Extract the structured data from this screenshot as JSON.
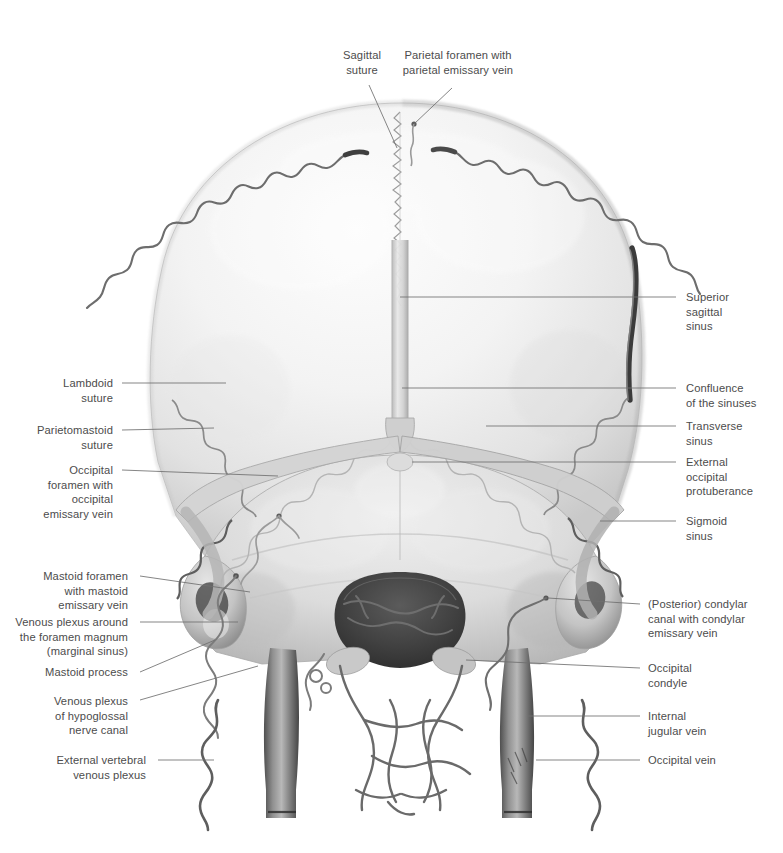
{
  "figure": {
    "kind": "anatomical-illustration",
    "view": "posterior view of skull with dural venous sinuses and emissary veins",
    "background_color": "#ffffff",
    "text_color": "#4c4c4c",
    "leader_color": "#6b6b6b",
    "bone_light": "#f4f4f4",
    "bone_mid": "#d8d8d8",
    "bone_shadow": "#9a9a9a",
    "vein_dark": "#4a4a4a",
    "vein_mid": "#8d8d8d"
  },
  "labels": {
    "sagittal_suture": "Sagittal\nsuture",
    "parietal_foramen": "Parietal foramen with\nparietal emissary vein",
    "superior_sagittal_sinus": "Superior\nsagittal\nsinus",
    "confluence_of_sinuses": "Confluence\nof the sinuses",
    "transverse_sinus": "Transverse\nsinus",
    "external_occipital_protuberance": "External\noccipital\nprotuberance",
    "sigmoid_sinus": "Sigmoid\nsinus",
    "posterior_condylar_canal": "(Posterior) condylar\ncanal with condylar\nemissary vein",
    "occipital_condyle": "Occipital\ncondyle",
    "internal_jugular_vein": "Internal\njugular vein",
    "occipital_vein": "Occipital vein",
    "lambdoid_suture": "Lambdoid\nsuture",
    "parietomastoid_suture": "Parietomastoid\nsuture",
    "occipital_foramen": "Occipital\nforamen with\noccipital\nemissary vein",
    "mastoid_foramen": "Mastoid foramen\nwith mastoid\nemissary vein",
    "venous_plexus_foramen_magnum": "Venous plexus around\nthe foramen magnum\n(marginal sinus)",
    "mastoid_process": "Mastoid process",
    "venous_plexus_hypoglossal": "Venous plexus\nof hypoglossal\nnerve canal",
    "external_vertebral_plexus": "External vertebral\nvenous plexus"
  }
}
